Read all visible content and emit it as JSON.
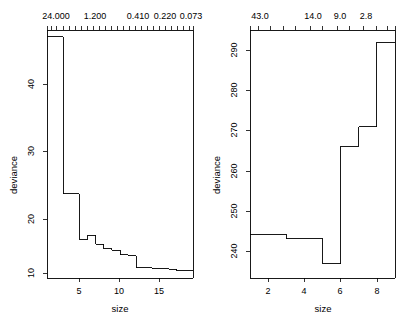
{
  "figure": {
    "background": "#ffffff",
    "line_color": "#000000",
    "panel_count": 2
  },
  "chart_data": [
    {
      "type": "line",
      "subtype": "step-function",
      "panel": "left",
      "title": "",
      "xlabel": "size",
      "ylabel": "deviance",
      "xlim": [
        1,
        19
      ],
      "ylim": [
        8.6,
        45.2
      ],
      "grid": false,
      "legend": null,
      "xticks": [
        5,
        10,
        15
      ],
      "xticklabels": [
        "5",
        "10",
        "15"
      ],
      "yticks": [
        10,
        20,
        30,
        40
      ],
      "yticklabels": [
        "10",
        "20",
        "30",
        "40"
      ],
      "top_axis": {
        "label": "",
        "ticklabels": [
          "24.000",
          "1.200",
          "0.410",
          "0.220",
          "0.073"
        ],
        "tickvalues": [
          1.55,
          3.1,
          8.6,
          12.0,
          16.2
        ],
        "minor_tickvalues": [
          1.0,
          1.55,
          2.2,
          3.1,
          3.9,
          4.7,
          5.5,
          6.3,
          7.1,
          7.9,
          8.6,
          9.4,
          10.2,
          11.0,
          11.8,
          12.0,
          12.9,
          13.7,
          14.5,
          15.3,
          16.2,
          17.0,
          17.8,
          18.6,
          19.0
        ]
      },
      "x": [
        1,
        2,
        3,
        4,
        5,
        6,
        7,
        8,
        9,
        10,
        11,
        12,
        13,
        14,
        15,
        16,
        17,
        18,
        19
      ],
      "values": [
        44.2,
        44.2,
        21.0,
        21.0,
        14.3,
        14.9,
        13.6,
        12.9,
        12.7,
        12.0,
        11.9,
        10.1,
        10.1,
        10.0,
        10.0,
        9.9,
        9.7,
        9.7,
        9.7
      ]
    },
    {
      "type": "line",
      "subtype": "step-function",
      "panel": "right",
      "title": "",
      "xlabel": "size",
      "ylabel": "deviance",
      "xlim": [
        1,
        9
      ],
      "ylim": [
        233.5,
        295.0
      ],
      "grid": false,
      "legend": null,
      "xticks": [
        2,
        4,
        6,
        8
      ],
      "xticklabels": [
        "2",
        "4",
        "6",
        "8"
      ],
      "yticks": [
        240,
        250,
        260,
        270,
        280,
        290
      ],
      "yticklabels": [
        "240",
        "250",
        "260",
        "270",
        "280",
        "290"
      ],
      "top_axis": {
        "label": "",
        "ticklabels": [
          "43.0",
          "14.0",
          "9.0",
          "2.8"
        ],
        "tickvalues": [
          1.45,
          4.35,
          5.85,
          7.3
        ],
        "minor_tickvalues": [
          1.0,
          1.45,
          2.1,
          2.8,
          3.5,
          4.35,
          5.0,
          5.85,
          6.5,
          7.3,
          8.0,
          8.6,
          9.0
        ]
      },
      "x": [
        1,
        2,
        3,
        4,
        5,
        6,
        7,
        8,
        9
      ],
      "values": [
        244.3,
        244.3,
        243.2,
        243.2,
        237.0,
        266.2,
        271.0,
        292.0,
        292.0
      ]
    }
  ]
}
